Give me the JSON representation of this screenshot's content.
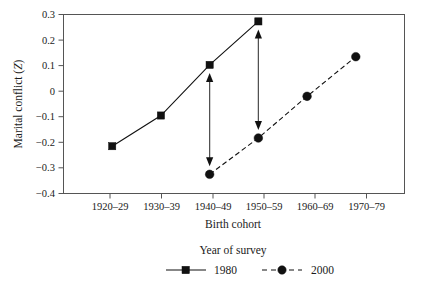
{
  "chart_data": {
    "type": "line",
    "title": "",
    "xlabel": "Birth cohort",
    "ylabel": "Marital conflict (Z)",
    "ylabel_main": "Marital conflict (",
    "ylabel_italic": "Z",
    "ylabel_close": ")",
    "categories": [
      "1920–29",
      "1930–39",
      "1940–49",
      "1950–59",
      "1960–69",
      "1970–79"
    ],
    "ylim": [
      -0.4,
      0.3
    ],
    "yticks": [
      "0.3",
      "0.2",
      "0.1",
      "0",
      "−0.1",
      "−0.2",
      "−0.3",
      "−0.4"
    ],
    "ytick_values": [
      0.3,
      0.2,
      0.1,
      0,
      -0.1,
      -0.2,
      -0.3,
      -0.4
    ],
    "grid": false,
    "legend_position": "below",
    "legend_title": "Year of survey",
    "series": [
      {
        "name": "1980",
        "marker": "square",
        "linestyle": "solid",
        "color": "#111111",
        "x": [
          "1920–29",
          "1930–39",
          "1940–49",
          "1950–59"
        ],
        "values": [
          -0.215,
          -0.095,
          0.103,
          0.273
        ]
      },
      {
        "name": "2000",
        "marker": "circle",
        "linestyle": "dashed",
        "color": "#111111",
        "x": [
          "1940–49",
          "1950–59",
          "1960–69",
          "1970–79"
        ],
        "values": [
          -0.325,
          -0.183,
          -0.02,
          0.135
        ]
      }
    ],
    "annotations": [
      {
        "name": "cohort-gap-arrow-1940-49",
        "type": "double-arrow",
        "x": "1940–49",
        "y_top": 0.103,
        "y_bottom": -0.325
      },
      {
        "name": "cohort-gap-arrow-1950-59",
        "type": "double-arrow",
        "x": "1950–59",
        "y_top": 0.273,
        "y_bottom": -0.183
      }
    ]
  },
  "legend": {
    "title": "Year of survey",
    "entries": [
      {
        "label": "1980",
        "marker": "square-marker",
        "style": "solid"
      },
      {
        "label": "2000",
        "marker": "circle-marker",
        "style": "dashed"
      }
    ]
  }
}
